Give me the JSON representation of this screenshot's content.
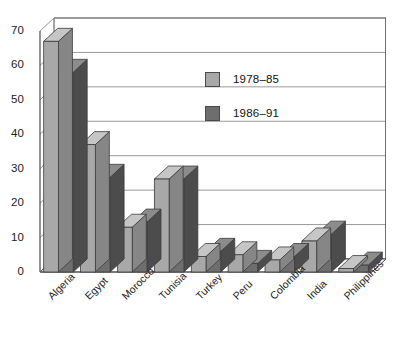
{
  "chart_data": {
    "type": "bar",
    "title": "",
    "subtitle": "",
    "xlabel": "",
    "ylabel": "",
    "ylim": [
      0,
      70
    ],
    "ytick_step": 10,
    "yticks": [
      0,
      10,
      20,
      30,
      40,
      50,
      60,
      70
    ],
    "grid": true,
    "grid_axis": "y",
    "legend_position": "inside-top-center",
    "three_d": true,
    "categories": [
      "Algeria",
      "Egypt",
      "Morocco",
      "Tunisia",
      "Turkey",
      "Peru",
      "Colombia",
      "India",
      "Philippines"
    ],
    "series": [
      {
        "name": "1978–85",
        "color": "#a8a8a8",
        "values": [
          67,
          37,
          13,
          27,
          4.5,
          5,
          3.5,
          9,
          1
        ]
      },
      {
        "name": "1986–91",
        "color": "#6e6e6e",
        "values": [
          58,
          27.5,
          14.5,
          27,
          6,
          2.5,
          4.5,
          11,
          2
        ]
      }
    ]
  },
  "legend": {
    "items": [
      {
        "label": "1978–85",
        "color": "#a8a8a8"
      },
      {
        "label": "1986–91",
        "color": "#6e6e6e"
      }
    ]
  },
  "axes": {
    "y_tick_labels": [
      "70",
      "60",
      "50",
      "40",
      "30",
      "20",
      "10",
      "0"
    ],
    "x_tick_labels": [
      "Algeria",
      "Egypt",
      "Morocco",
      "Tunisia",
      "Turkey",
      "Peru",
      "Colombia",
      "India",
      "Philippines"
    ]
  },
  "colors": {
    "series_light": "#a8a8a8",
    "series_dark": "#6e6e6e",
    "gridline": "#8d8d8d",
    "frame": "#4f4f4f",
    "text": "#1d1d1d",
    "background": "#ffffff"
  }
}
